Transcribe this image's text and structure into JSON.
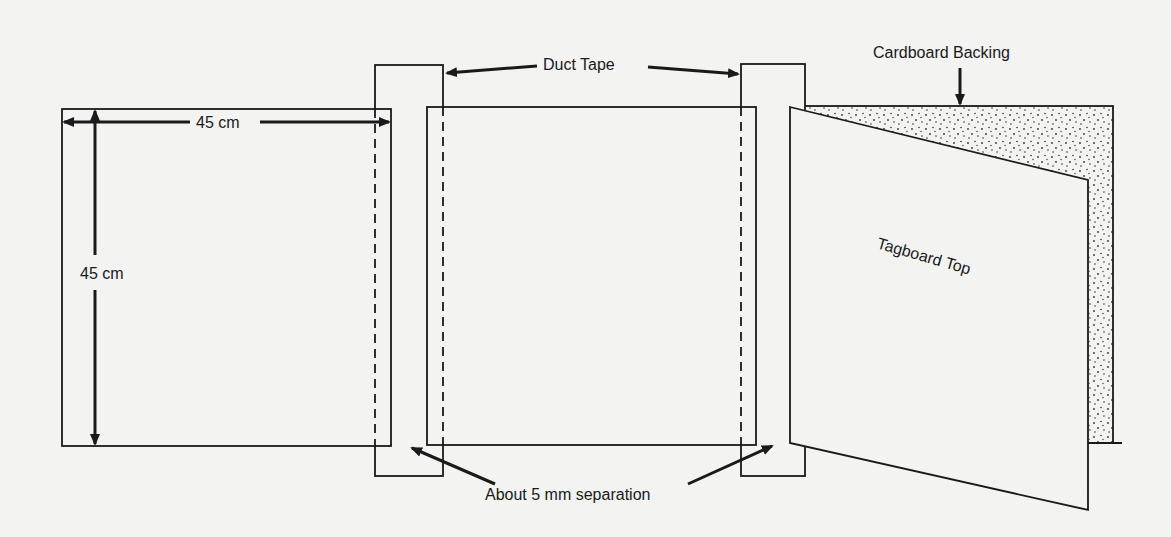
{
  "diagram": {
    "labels": {
      "width_dimension": "45 cm",
      "height_dimension": "45 cm",
      "duct_tape": "Duct Tape",
      "cardboard_backing": "Cardboard Backing",
      "tagboard_top": "Tagboard Top",
      "separation": "About 5 mm separation"
    },
    "colors": {
      "ink": "#1a1a1a",
      "paper": "#f3f3f2",
      "stipple": "#333333"
    },
    "components": [
      {
        "name": "left-square",
        "x": 62,
        "y": 109,
        "w": 329,
        "h": 337
      },
      {
        "name": "middle-square",
        "x": 427,
        "y": 107,
        "w": 329,
        "h": 338
      },
      {
        "name": "left-duct-tape",
        "x": 375,
        "y": 65,
        "w": 68,
        "h": 411
      },
      {
        "name": "right-duct-tape",
        "x": 741,
        "y": 64,
        "w": 64,
        "h": 412
      },
      {
        "name": "cardboard-backing",
        "x": 790,
        "y": 106,
        "w": 323,
        "h": 337
      },
      {
        "name": "tagboard-top",
        "points": [
          [
            790,
            107
          ],
          [
            1088,
            180
          ],
          [
            1088,
            510
          ],
          [
            790,
            443
          ]
        ]
      }
    ]
  }
}
